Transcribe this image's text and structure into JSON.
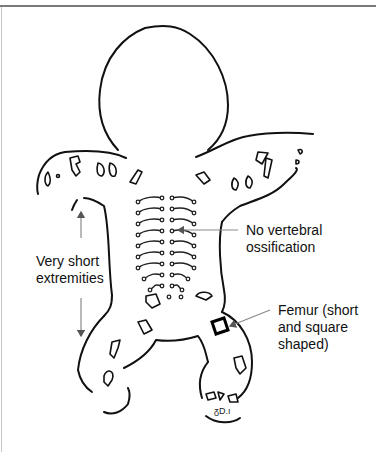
{
  "figure": {
    "annotations": [
      {
        "id": "extremities",
        "text": "Very short\nextremities",
        "pointer": "double-vertical-arrow"
      },
      {
        "id": "vertebral",
        "text": "No vertebral\nossification",
        "pointer": "arrow-left-to-spine"
      },
      {
        "id": "femur",
        "text": "Femur (short\nand square\nshaped)",
        "pointer": "arrow-to-femur"
      }
    ]
  },
  "colors": {
    "line": "#111111",
    "pointer": "#8a8a8a",
    "background": "#ffffff",
    "frame_top": "#7a7a7a"
  }
}
